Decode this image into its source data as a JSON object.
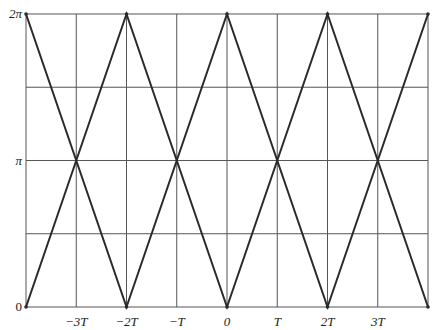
{
  "chart_data": {
    "type": "line",
    "title": "",
    "xlabel": "",
    "ylabel": "",
    "x_ticks": [
      {
        "value": -3,
        "label": "−3T"
      },
      {
        "value": -2,
        "label": "−2T"
      },
      {
        "value": -1,
        "label": "−T"
      },
      {
        "value": 0,
        "label": "0"
      },
      {
        "value": 1,
        "label": "T"
      },
      {
        "value": 2,
        "label": "2T"
      },
      {
        "value": 3,
        "label": "3T"
      }
    ],
    "y_ticks": [
      {
        "value": 0,
        "label": "0"
      },
      {
        "value": 3.14159,
        "label": "π"
      },
      {
        "value": 6.28319,
        "label": "2π"
      }
    ],
    "xlim": [
      -4,
      4
    ],
    "ylim": [
      0,
      6.28319
    ],
    "grid": {
      "x_step_T": 1,
      "y_step": 1.5708
    },
    "series": [
      {
        "name": "rising-falling",
        "x": [
          -4,
          -2,
          0,
          2,
          4
        ],
        "y": [
          0,
          6.28319,
          0,
          6.28319,
          0
        ]
      },
      {
        "name": "falling-rising",
        "x": [
          -4,
          -2,
          0,
          2,
          4
        ],
        "y": [
          6.28319,
          0,
          6.28319,
          0,
          6.28319
        ]
      }
    ],
    "line_color": "#2a2a2a",
    "grid_color": "#555555"
  }
}
